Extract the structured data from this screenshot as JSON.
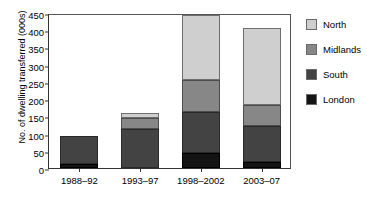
{
  "chart_data": {
    "type": "bar",
    "subtype": "stacked-bar",
    "title": "",
    "xlabel": "",
    "ylabel": "No. of dwelling transferred (000s)",
    "categories": [
      "1988–92",
      "1993–97",
      "1998–2002",
      "2003–07"
    ],
    "yticks": [
      0,
      50,
      100,
      150,
      200,
      250,
      300,
      350,
      400,
      450
    ],
    "ytick_labels": [
      "0",
      "50",
      "100",
      "150",
      "200",
      "250",
      "300",
      "350",
      "400",
      "450"
    ],
    "ylim": [
      0,
      450
    ],
    "grid": false,
    "legend_position": "right",
    "series": [
      {
        "name": "London",
        "color": "#141414",
        "values": [
          11,
          0,
          45,
          18
        ]
      },
      {
        "name": "South",
        "color": "#434343",
        "values": [
          81,
          112,
          118,
          104
        ]
      },
      {
        "name": "Midlands",
        "color": "#878787",
        "values": [
          0,
          33,
          92,
          61
        ]
      },
      {
        "name": "North",
        "color": "#cfcfcf",
        "values": [
          0,
          15,
          190,
          223
        ]
      }
    ],
    "totals": [
      92,
      160,
      445,
      406
    ],
    "stack_order_bottom_to_top": [
      "London",
      "South",
      "Midlands",
      "North"
    ]
  },
  "legend": {
    "items": [
      {
        "label": "North",
        "color": "#cfcfcf"
      },
      {
        "label": "Midlands",
        "color": "#878787"
      },
      {
        "label": "South",
        "color": "#434343"
      },
      {
        "label": "London",
        "color": "#141414"
      }
    ]
  }
}
